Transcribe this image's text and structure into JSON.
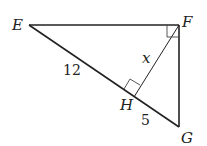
{
  "diagram": {
    "type": "right triangle with altitude",
    "vertices": {
      "E": {
        "label": "E",
        "x": 29,
        "y": 25
      },
      "F": {
        "label": "F",
        "x": 179,
        "y": 25
      },
      "G": {
        "label": "G",
        "x": 179,
        "y": 127
      },
      "H": {
        "label": "H",
        "x": 132,
        "y": 95
      }
    },
    "segments": [
      {
        "from": "E",
        "to": "F"
      },
      {
        "from": "F",
        "to": "G"
      },
      {
        "from": "E",
        "to": "G"
      },
      {
        "from": "F",
        "to": "H"
      }
    ],
    "right_angles": [
      "F",
      "H"
    ],
    "measures": {
      "EH": "12",
      "HG": "5",
      "FH": "x"
    },
    "stroke_color": "#222222"
  }
}
